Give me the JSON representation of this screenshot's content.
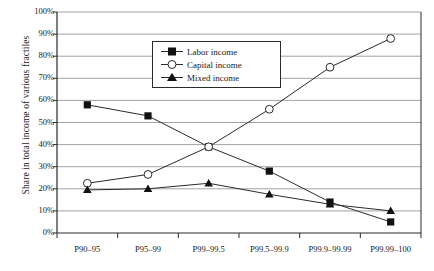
{
  "chart_data": {
    "type": "line",
    "title": "",
    "xlabel": "",
    "ylabel": "Share in total income of various fractiles",
    "categories": [
      "P90–95",
      "P95–99",
      "P99–99.5",
      "P99.5–99.9",
      "P99.9–99.99",
      "P99.99–100"
    ],
    "ylim": [
      0,
      100
    ],
    "yticks": [
      "0%",
      "10%",
      "20%",
      "30%",
      "40%",
      "50%",
      "60%",
      "70%",
      "80%",
      "90%",
      "100%"
    ],
    "ytick_values": [
      0,
      10,
      20,
      30,
      40,
      50,
      60,
      70,
      80,
      90,
      100
    ],
    "grid": true,
    "legend_position": "top-center",
    "series": [
      {
        "name": "Labor income",
        "marker": "filled-square",
        "values": [
          58,
          53,
          39,
          28,
          14,
          5
        ]
      },
      {
        "name": "Capital income",
        "marker": "open-circle",
        "values": [
          22.5,
          26.5,
          39,
          56,
          75,
          88
        ]
      },
      {
        "name": "Mixed income",
        "marker": "filled-triangle",
        "values": [
          19.5,
          20,
          22.5,
          17.5,
          13,
          10
        ]
      }
    ]
  },
  "colors": {
    "line": "#2b2b2b",
    "grid": "#8c8c8c",
    "axis": "#2b2b2b",
    "text": "#1a1a1a",
    "background": "#ffffff"
  }
}
